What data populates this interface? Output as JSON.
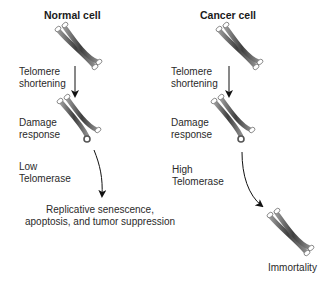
{
  "normal": {
    "title": "Normal cell",
    "step1": [
      "Telomere",
      "shortening"
    ],
    "step2": [
      "Damage",
      "response"
    ],
    "step3": [
      "Low",
      "Telomerase"
    ],
    "outcome": [
      "Replicative senescence,",
      "apoptosis, and tumor suppression"
    ]
  },
  "cancer": {
    "title": "Cancer cell",
    "step1": [
      "Telomere",
      "shortening"
    ],
    "step2": [
      "Damage",
      "response"
    ],
    "step3": [
      "High",
      "Telomerase"
    ],
    "outcome": [
      "Immortality"
    ]
  },
  "colors": {
    "chromosome": "#555555",
    "telomere": "#ffffff",
    "arrow": "#111111"
  }
}
